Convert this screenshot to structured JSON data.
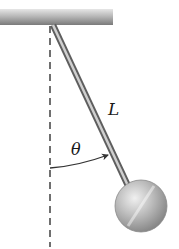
{
  "diagram": {
    "labels": {
      "length": "L",
      "angle": "θ"
    },
    "elements": {
      "ceiling": "fixed support bar",
      "rod": "rigid rod of length L",
      "bob": "spherical mass",
      "reference_line": "vertical dashed line",
      "angle_arrow": "arc arrow from vertical to rod"
    },
    "colors": {
      "rod": "#8a8a8a",
      "bob": "#b5b5b5",
      "ceiling": "#a8a8a8",
      "dashed_line": "#333333",
      "text": "#1a1a1a"
    }
  }
}
